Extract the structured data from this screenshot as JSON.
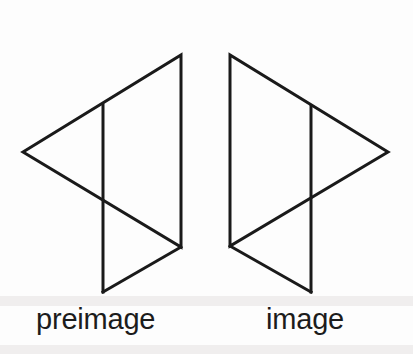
{
  "figure": {
    "background_color": "#fdfdfd",
    "stroke_color": "#1a1a1a",
    "stroke_width": 3,
    "width": 413,
    "height": 354
  },
  "captions": {
    "left_label": "preimage",
    "right_label": "image",
    "font_size_px": 29,
    "text_color": "#1c1c1c"
  },
  "chart_data": {
    "type": "diagram",
    "transformation": "reflection",
    "axis_of_symmetry_x": 205.5,
    "shapes": [
      {
        "name": "preimage",
        "label": "preimage",
        "kind": "triangle",
        "orientation": "points-left",
        "vertices": [
          {
            "x": 23,
            "y": 152
          },
          {
            "x": 181,
            "y": 55
          },
          {
            "x": 181,
            "y": 247
          }
        ],
        "extra_segments": [
          {
            "name": "inner-vertical-segment",
            "from": {
              "x": 103,
              "y": 105
            },
            "to": {
              "x": 103,
              "y": 292
            }
          },
          {
            "name": "lower-diagonal-extension",
            "from": {
              "x": 181,
              "y": 247
            },
            "to": {
              "x": 103,
              "y": 292
            }
          }
        ]
      },
      {
        "name": "image",
        "label": "image",
        "kind": "triangle",
        "orientation": "points-right",
        "vertices": [
          {
            "x": 388,
            "y": 152
          },
          {
            "x": 230,
            "y": 55
          },
          {
            "x": 230,
            "y": 246
          }
        ],
        "extra_segments": [
          {
            "name": "inner-vertical-segment",
            "from": {
              "x": 311,
              "y": 106
            },
            "to": {
              "x": 311,
              "y": 292
            }
          },
          {
            "name": "lower-diagonal-extension",
            "from": {
              "x": 230,
              "y": 246
            },
            "to": {
              "x": 311,
              "y": 292
            }
          }
        ]
      }
    ]
  }
}
